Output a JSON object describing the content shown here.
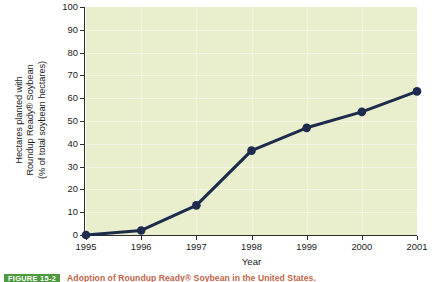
{
  "chart_data": {
    "type": "line",
    "title": "",
    "xlabel": "Year",
    "ylabel": "Hectares planted with Roundup Ready® Soybean (% of total soybean hectares)",
    "ylabel_lines": [
      "Hectares planted with",
      "Roundup Ready® Soybean",
      "(% of total soybean hectares)"
    ],
    "categories": [
      "1995",
      "1996",
      "1997",
      "1998",
      "1999",
      "2000",
      "2001"
    ],
    "x": [
      1995,
      1996,
      1997,
      1998,
      1999,
      2000,
      2001
    ],
    "values": [
      0,
      2,
      13,
      37,
      47,
      54,
      63
    ],
    "series": [
      {
        "name": "Roundup Ready Soybean",
        "values": [
          0,
          2,
          13,
          37,
          47,
          54,
          63
        ]
      }
    ],
    "xlim": [
      1995,
      2001
    ],
    "ylim": [
      0,
      100
    ],
    "y_ticks": [
      0,
      10,
      20,
      30,
      40,
      50,
      60,
      70,
      80,
      90,
      100
    ],
    "y_tick_labels": [
      "0",
      "10",
      "20",
      "30",
      "40",
      "50",
      "60",
      "70",
      "80",
      "90",
      "100"
    ],
    "x_ticks": [
      1995,
      1996,
      1997,
      1998,
      1999,
      2000,
      2001
    ],
    "x_tick_labels": [
      "1995",
      "1996",
      "1997",
      "1998",
      "1999",
      "2000",
      "2001"
    ],
    "grid": false,
    "legend": "none",
    "marker": "filled-circle",
    "line_color": "#1d2b4d",
    "marker_color": "#1d2b4d",
    "plot_background": "#e9eecc",
    "figure_background": "#ffffff",
    "axis_color": "#2c2c2c",
    "text_color": "#1a1a1a"
  },
  "caption": {
    "figure_number": "FIGURE 15-2",
    "text": "Adoption of Roundup Ready® Soybean in the United States.",
    "badge_color": "#4e9a3e",
    "text_color": "#c0654a"
  }
}
